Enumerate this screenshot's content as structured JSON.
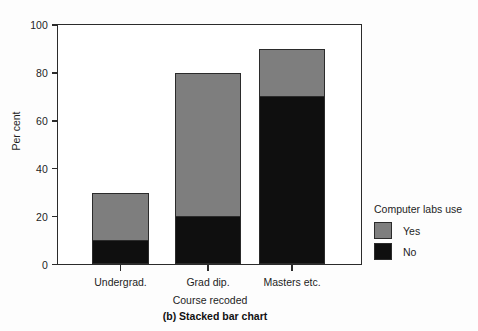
{
  "figure": {
    "caption": "(b) Stacked bar chart"
  },
  "legend": {
    "title": "Computer labs use",
    "entries": [
      {
        "label": "Yes",
        "color": "#7e7e7e"
      },
      {
        "label": "No",
        "color": "#0f0f0f"
      }
    ]
  },
  "axes": {
    "y_title": "Per cent",
    "x_title": "Course recoded",
    "y_ticks": [
      "0",
      "20",
      "40",
      "60",
      "80",
      "100"
    ],
    "x_ticks": [
      "Undergrad.",
      "Grad dip.",
      "Masters etc."
    ]
  },
  "chart_data": {
    "type": "bar",
    "title": "(b) Stacked bar chart",
    "stacked": true,
    "categories": [
      "Undergrad.",
      "Grad dip.",
      "Masters etc."
    ],
    "series": [
      {
        "name": "No",
        "color": "#0f0f0f",
        "values": [
          10,
          20,
          70
        ]
      },
      {
        "name": "Yes",
        "color": "#7e7e7e",
        "values": [
          20,
          60,
          20
        ]
      }
    ],
    "totals": [
      30,
      80,
      90
    ],
    "xlabel": "Course recoded",
    "ylabel": "Per cent",
    "ylim": [
      0,
      100
    ],
    "yticks": [
      0,
      20,
      40,
      60,
      80,
      100
    ],
    "grid": false,
    "legend_title": "Computer labs use",
    "legend_position": "right"
  }
}
